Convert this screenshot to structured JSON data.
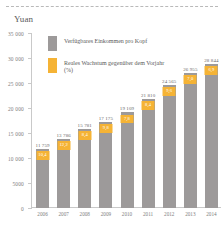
{
  "axis_unit_label": "Yuan",
  "legend": {
    "items": [
      {
        "label": "Verfügbares Einkommen pro Kopf",
        "color": "#9d9a9a",
        "swatch": "grey"
      },
      {
        "label": "Reales Wachstum gegenüber dem Vorjahr (%)",
        "color": "#f5b335",
        "swatch": "orange"
      }
    ]
  },
  "chart_data": {
    "type": "bar",
    "title": "",
    "subtitle": "",
    "xlabel": "",
    "ylabel": "Yuan",
    "ylim": [
      0,
      35000
    ],
    "grid": false,
    "legend_position": "top-left-inside",
    "categories": [
      "2006",
      "2007",
      "2008",
      "2009",
      "2010",
      "2011",
      "2012",
      "2013",
      "2014"
    ],
    "ytick_labels": [
      "35 000",
      "30 000",
      "25 000",
      "20 000",
      "15 000",
      "10 000",
      "5000",
      "0"
    ],
    "ytick_values": [
      35000,
      30000,
      25000,
      20000,
      15000,
      10000,
      5000,
      0
    ],
    "series": [
      {
        "name": "Verfügbares Einkommen pro Kopf",
        "color": "#9d9a9a",
        "values": [
          11759,
          13786,
          15781,
          17175,
          19109,
          21810,
          24565,
          26955,
          28844
        ],
        "value_labels": [
          "11 759",
          "13 786",
          "15 781",
          "17 175",
          "19 109",
          "21 810",
          "24 565",
          "26 955",
          "28 844"
        ]
      },
      {
        "name": "Reales Wachstum gegenüber dem Vorjahr (%)",
        "color": "#f5b335",
        "values": [
          10.4,
          12.2,
          8.4,
          9.8,
          7.8,
          8.4,
          9.6,
          7.0,
          6.9
        ],
        "value_labels": [
          "10,4",
          "12,2",
          "8,4",
          "9,8",
          "7,8",
          "8,4",
          "9,6",
          "7,0",
          "6,9"
        ]
      }
    ]
  }
}
